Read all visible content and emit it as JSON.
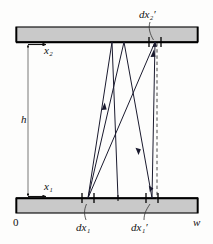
{
  "figure": {
    "colors": {
      "plate_fill": "#c9c9c9",
      "plate_stroke": "#000000",
      "ray_stroke": "#1a1a2e",
      "dashed_stroke": "#333333",
      "background": "#fdfdfc",
      "text": "#111111"
    },
    "labels": {
      "x2": {
        "base": "x",
        "sub": "2",
        "prime": ""
      },
      "x1": {
        "base": "x",
        "sub": "1",
        "prime": ""
      },
      "h": {
        "base": "h",
        "sub": "",
        "prime": ""
      },
      "origin": {
        "base": "0",
        "sub": "",
        "prime": ""
      },
      "width": {
        "base": "w",
        "sub": "",
        "prime": ""
      },
      "dx1": {
        "base": "dx",
        "sub": "1",
        "prime": ""
      },
      "dx1_prime": {
        "base": "dx",
        "sub": "1",
        "prime": "′"
      },
      "dx2_prime": {
        "base": "dx",
        "sub": "2",
        "prime": "′"
      }
    },
    "label_text": {
      "x2": "x₂",
      "x1": "x₁",
      "h": "h",
      "origin": "0",
      "width": "w",
      "dx1": "dx₁",
      "dx1_prime": "dx₁′",
      "dx2_prime": "dx₂′"
    },
    "geometry": {
      "plate_left_x": 16,
      "plate_right_x": 198,
      "top_plate_y_top": 27,
      "top_plate_y_bottom": 42,
      "bottom_plate_y_top": 198,
      "bottom_plate_y_bottom": 213,
      "height_arrow_x": 28,
      "dashed_line_x": 157,
      "dx1_center_x": 88,
      "dx1_prime_center_x": 152,
      "dx2_prime_center_x": 155
    },
    "tick_marks": {
      "bottom_left_element": [
        82,
        94
      ],
      "bottom_right_element": [
        146,
        158
      ],
      "bottom_middle_vertex": 118,
      "top_element": [
        149,
        161
      ]
    },
    "rays": [
      {
        "from_x": 88,
        "from_y": 198,
        "to_x": 112,
        "to_y": 42,
        "arrow_at": 0.45
      },
      {
        "from_x": 88,
        "from_y": 198,
        "to_x": 124,
        "to_y": 42,
        "arrow_at": 0.0
      },
      {
        "from_x": 88,
        "from_y": 198,
        "to_x": 155,
        "to_y": 42,
        "arrow_at": 0.0
      },
      {
        "from_x": 112,
        "from_y": 42,
        "to_x": 118,
        "to_y": 198,
        "arrow_at": 0.0
      },
      {
        "from_x": 124,
        "from_y": 42,
        "to_x": 152,
        "to_y": 198,
        "arrow_at": 0.55
      },
      {
        "from_x": 152,
        "from_y": 198,
        "to_x": 155,
        "to_y": 42,
        "arrow_at": 0.0
      }
    ]
  }
}
